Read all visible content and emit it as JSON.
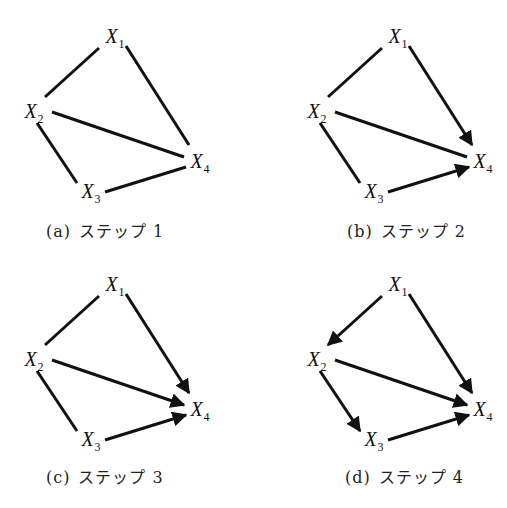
{
  "figure": {
    "edge_color": "#111111",
    "panels": [
      {
        "id": "a",
        "tag": "(a)",
        "caption_text": "ステップ",
        "step_number": "1",
        "nodes": [
          {
            "name": "X",
            "sub": "1"
          },
          {
            "name": "X",
            "sub": "2"
          },
          {
            "name": "X",
            "sub": "3"
          },
          {
            "name": "X",
            "sub": "4"
          }
        ],
        "edges": [
          {
            "from": "X1",
            "to": "X2",
            "directed": false
          },
          {
            "from": "X1",
            "to": "X4",
            "directed": false
          },
          {
            "from": "X2",
            "to": "X4",
            "directed": false
          },
          {
            "from": "X2",
            "to": "X3",
            "directed": false
          },
          {
            "from": "X3",
            "to": "X4",
            "directed": false
          }
        ]
      },
      {
        "id": "b",
        "tag": "(b)",
        "caption_text": "ステップ",
        "step_number": "2",
        "nodes": [
          {
            "name": "X",
            "sub": "1"
          },
          {
            "name": "X",
            "sub": "2"
          },
          {
            "name": "X",
            "sub": "3"
          },
          {
            "name": "X",
            "sub": "4"
          }
        ],
        "edges": [
          {
            "from": "X1",
            "to": "X2",
            "directed": false
          },
          {
            "from": "X1",
            "to": "X4",
            "directed": true
          },
          {
            "from": "X2",
            "to": "X4",
            "directed": false
          },
          {
            "from": "X2",
            "to": "X3",
            "directed": false
          },
          {
            "from": "X3",
            "to": "X4",
            "directed": true
          }
        ]
      },
      {
        "id": "c",
        "tag": "(c)",
        "caption_text": "ステップ",
        "step_number": "3",
        "nodes": [
          {
            "name": "X",
            "sub": "1"
          },
          {
            "name": "X",
            "sub": "2"
          },
          {
            "name": "X",
            "sub": "3"
          },
          {
            "name": "X",
            "sub": "4"
          }
        ],
        "edges": [
          {
            "from": "X1",
            "to": "X2",
            "directed": false
          },
          {
            "from": "X1",
            "to": "X4",
            "directed": true
          },
          {
            "from": "X2",
            "to": "X4",
            "directed": true
          },
          {
            "from": "X2",
            "to": "X3",
            "directed": false
          },
          {
            "from": "X3",
            "to": "X4",
            "directed": true
          }
        ]
      },
      {
        "id": "d",
        "tag": "(d)",
        "caption_text": "ステップ",
        "step_number": "4",
        "nodes": [
          {
            "name": "X",
            "sub": "1"
          },
          {
            "name": "X",
            "sub": "2"
          },
          {
            "name": "X",
            "sub": "3"
          },
          {
            "name": "X",
            "sub": "4"
          }
        ],
        "edges": [
          {
            "from": "X1",
            "to": "X2",
            "directed": true
          },
          {
            "from": "X1",
            "to": "X4",
            "directed": true
          },
          {
            "from": "X2",
            "to": "X4",
            "directed": true
          },
          {
            "from": "X2",
            "to": "X3",
            "directed": true
          },
          {
            "from": "X3",
            "to": "X4",
            "directed": true
          }
        ]
      }
    ]
  }
}
